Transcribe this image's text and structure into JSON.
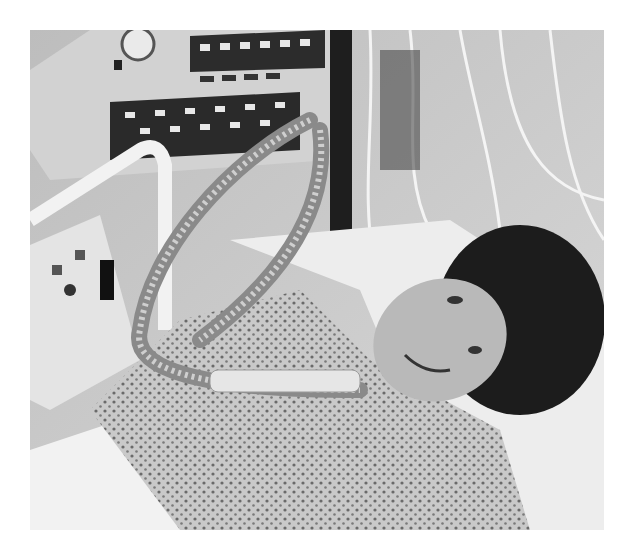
{
  "image": {
    "kind": "photograph",
    "color_mode": "grayscale",
    "frame": {
      "x": 30,
      "y": 30,
      "width": 574,
      "height": 500,
      "background": "#ffffff"
    },
    "subject": "patient lying in hospital bed connected to a mechanical ventilator via tracheostomy tubing",
    "regions": [
      {
        "name": "ventilator-control-panel",
        "position": "top-left",
        "description": "ventilator with dial gauge and rows of buttons, no legible text"
      },
      {
        "name": "bed-side-rail",
        "position": "left",
        "description": "bed rail with small control panel"
      },
      {
        "name": "ventilator-tubing",
        "position": "center",
        "description": "corrugated breathing hoses looping down to patient"
      },
      {
        "name": "iv-lines-and-cables",
        "position": "top-right",
        "description": "hanging tubes and cables"
      },
      {
        "name": "patient-face",
        "position": "right-center",
        "description": "smiling patient with dark hair resting on pillow"
      },
      {
        "name": "patient-gown",
        "position": "bottom",
        "description": "dotted-pattern hospital gown"
      },
      {
        "name": "bed-sheets",
        "position": "bottom-left and right",
        "description": "white sheets and pillow"
      }
    ]
  }
}
